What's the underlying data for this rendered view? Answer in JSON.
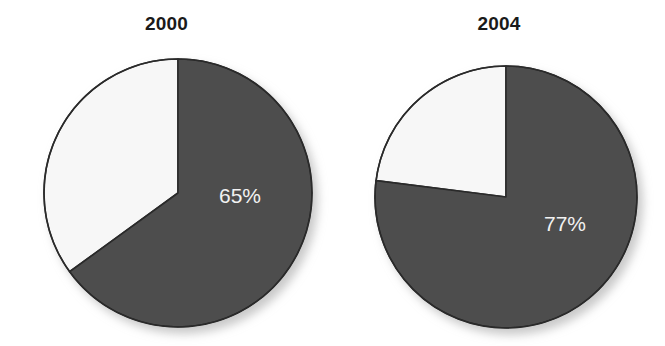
{
  "figure": {
    "background": "#ffffff",
    "width": 665,
    "height": 346
  },
  "chart_data": [
    {
      "type": "pie",
      "title": "2000",
      "categories": [
        "Share",
        "Remainder"
      ],
      "values": [
        65,
        35
      ],
      "labels": [
        "65%",
        ""
      ],
      "colors": [
        "#4e4e4e",
        "#f7f7f7"
      ],
      "start_angle_deg": 0,
      "direction": "clockwise",
      "xlabel": "",
      "ylabel": "",
      "legend": "none",
      "grid": false,
      "value_label": "65%",
      "value_label_color": "#f2f2f2"
    },
    {
      "type": "pie",
      "title": "2004",
      "categories": [
        "Share",
        "Remainder"
      ],
      "values": [
        77,
        23
      ],
      "labels": [
        "77%",
        ""
      ],
      "colors": [
        "#4e4e4e",
        "#f7f7f7"
      ],
      "start_angle_deg": 0,
      "direction": "clockwise",
      "xlabel": "",
      "ylabel": "",
      "legend": "none",
      "grid": false,
      "value_label": "77%",
      "value_label_color": "#f2f2f2"
    }
  ],
  "panels": [
    {
      "title": "2000",
      "value_label": "65%",
      "geometry": {
        "cx": 178,
        "cy": 193,
        "r": 134,
        "label_x": 240,
        "label_y": 203
      },
      "slices": [
        {
          "name": "dark-slice",
          "percent": 65,
          "color": "#4e4e4e"
        },
        {
          "name": "light-slice",
          "percent": 35,
          "color": "#f7f7f7"
        }
      ]
    },
    {
      "title": "2004",
      "value_label": "77%",
      "geometry": {
        "cx": 506,
        "cy": 197,
        "r": 131,
        "label_x": 565,
        "label_y": 231
      },
      "slices": [
        {
          "name": "dark-slice",
          "percent": 77,
          "color": "#4e4e4e"
        },
        {
          "name": "light-slice",
          "percent": 23,
          "color": "#f7f7f7"
        }
      ]
    }
  ],
  "style": {
    "outline_color": "#2b2b2b",
    "outline_width": 1.6,
    "shadow_color": "#c9c9c9"
  }
}
